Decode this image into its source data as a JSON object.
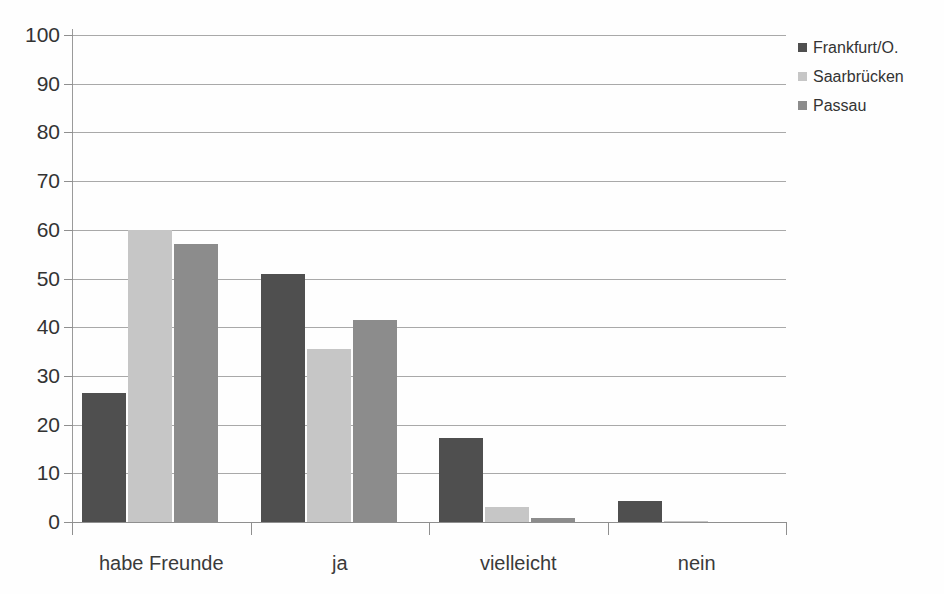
{
  "chart_data": {
    "type": "bar",
    "title": "",
    "xlabel": "",
    "ylabel": "",
    "ylim": [
      0,
      100
    ],
    "yticks": [
      0,
      10,
      20,
      30,
      40,
      50,
      60,
      70,
      80,
      90,
      100
    ],
    "grid": true,
    "legend_position": "right",
    "categories": [
      "habe Freunde",
      "ja",
      "vielleicht",
      "nein"
    ],
    "series": [
      {
        "name": "Frankfurt/O.",
        "color": "#4f4f4f",
        "values": [
          26.5,
          51.0,
          17.3,
          4.3
        ]
      },
      {
        "name": "Saarbrücken",
        "color": "#c6c6c6",
        "values": [
          60.0,
          35.5,
          3.0,
          0.2
        ]
      },
      {
        "name": "Passau",
        "color": "#8c8c8c",
        "values": [
          57.0,
          41.5,
          0.8,
          0.0
        ]
      }
    ]
  },
  "axis": {
    "tick_labels": [
      "100",
      "90",
      "80",
      "70",
      "60",
      "50",
      "40",
      "30",
      "20",
      "10",
      "0"
    ]
  },
  "legend": {
    "items": [
      {
        "label": "Frankfurt/O.",
        "color": "#4f4f4f"
      },
      {
        "label": "Saarbrücken",
        "color": "#c6c6c6"
      },
      {
        "label": "Passau",
        "color": "#8c8c8c"
      }
    ]
  },
  "colors": {
    "gridline": "#a9a9a9",
    "axis": "#8f8f8f",
    "text": "#333333",
    "background": "#ffffff"
  }
}
